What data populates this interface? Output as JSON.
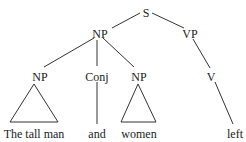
{
  "tree": {
    "root": {
      "label": "S"
    },
    "nodes": {
      "np_main": {
        "label": "NP"
      },
      "vp": {
        "label": "VP"
      },
      "np_left": {
        "label": "NP"
      },
      "conj": {
        "label": "Conj"
      },
      "np_right": {
        "label": "NP"
      },
      "v": {
        "label": "V"
      }
    },
    "leaves": {
      "np_left_text": "The tall man",
      "conj_text": "and",
      "np_right_text": "women",
      "v_text": "left"
    }
  }
}
